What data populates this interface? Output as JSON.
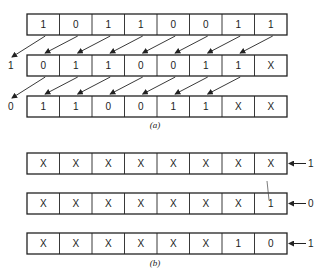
{
  "diagram": {
    "part_a": {
      "caption": "(a)",
      "registers": [
        {
          "bits": [
            "1",
            "0",
            "1",
            "1",
            "0",
            "0",
            "1",
            "1"
          ],
          "shift_out": ""
        },
        {
          "bits": [
            "0",
            "1",
            "1",
            "0",
            "0",
            "1",
            "1",
            "X"
          ],
          "shift_out": "1"
        },
        {
          "bits": [
            "1",
            "1",
            "0",
            "0",
            "1",
            "1",
            "X",
            "X"
          ],
          "shift_out": "0"
        }
      ],
      "shift_direction": "left"
    },
    "part_b": {
      "caption": "(b)",
      "registers": [
        {
          "bits": [
            "X",
            "X",
            "X",
            "X",
            "X",
            "X",
            "X",
            "X"
          ],
          "shift_in": "1"
        },
        {
          "bits": [
            "X",
            "X",
            "X",
            "X",
            "X",
            "X",
            "X",
            "1"
          ],
          "shift_in": "0"
        },
        {
          "bits": [
            "X",
            "X",
            "X",
            "X",
            "X",
            "X",
            "1",
            "0"
          ],
          "shift_in": "1"
        }
      ],
      "shift_direction": "left"
    }
  }
}
